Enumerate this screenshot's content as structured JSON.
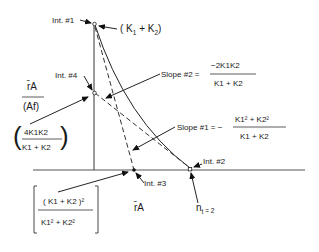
{
  "points": {
    "int1": {
      "label": "Int. #1",
      "value": "( K1 + K2 )"
    },
    "int2": {
      "label": "Int. #2"
    },
    "int3": {
      "label": "Int. #3"
    },
    "int4": {
      "label": "Int. #4"
    }
  },
  "y_axis_label": {
    "numerator": "r̄A",
    "denominator": "(Af)"
  },
  "x_axis_label": "r̄A",
  "int1_value": {
    "open": "( K",
    "sub1": "1",
    "plus": " + K",
    "sub2": "2",
    "close": ")"
  },
  "int4_value": {
    "numerator": "4K1K2",
    "denominator": "K1 + K2"
  },
  "int3_value": {
    "numerator": "( K1 + K2 )²",
    "denominator": "K1² + K2²"
  },
  "slope2": {
    "label": "Slope #2 =",
    "numerator": "−2K1K2",
    "denominator": "K1 + K2"
  },
  "slope1": {
    "label": "Slope #1 = −",
    "numerator": "K1² + K2²",
    "denominator": "K1 + K2"
  },
  "nt_label": {
    "text": "n",
    "sub": "t",
    "rest": " = 2"
  }
}
